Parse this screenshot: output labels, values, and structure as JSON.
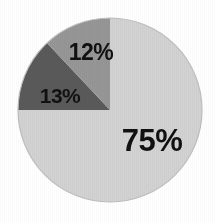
{
  "chart_data": {
    "type": "pie",
    "title": "",
    "subtitle": "",
    "xlabel": "",
    "ylabel": "",
    "grid": false,
    "legend": "none",
    "units": "percent",
    "total": 100,
    "start_angle_deg": 0,
    "direction": "clockwise",
    "categories": [
      "75%",
      "13%",
      "12%"
    ],
    "values": [
      75,
      13,
      12
    ],
    "labels": [
      "75%",
      "13%",
      "12%"
    ],
    "colors": [
      "#d2d2d2",
      "#5a5a5a",
      "#969696"
    ],
    "slices": [
      {
        "label": "75%",
        "value": 75,
        "color": "#d2d2d2",
        "start_angle_deg": 0,
        "end_angle_deg": 270,
        "label_x": 152,
        "label_y": 140
      },
      {
        "label": "13%",
        "value": 13,
        "color": "#5a5a5a",
        "start_angle_deg": 270,
        "end_angle_deg": 316.8,
        "label_x": 60,
        "label_y": 95
      },
      {
        "label": "12%",
        "value": 12,
        "color": "#969696",
        "start_angle_deg": 316.8,
        "end_angle_deg": 360,
        "label_x": 91,
        "label_y": 52
      }
    ]
  },
  "figure": {
    "background_color": "#ffffff",
    "outline_color": "#bdbdbd",
    "center_x": 110,
    "center_y": 110,
    "radius": 92
  }
}
